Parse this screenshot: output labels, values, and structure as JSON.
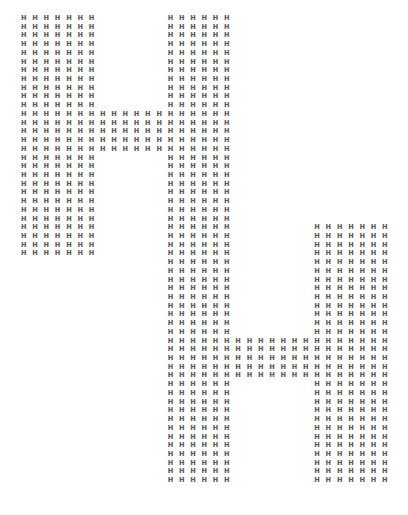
{
  "artwork": {
    "glyph": "H",
    "color": "#5a5a5a",
    "background": "#ffffff",
    "columns": 34,
    "description": "Two block letters 'H' drawn with repeated H characters, offset diagonally",
    "rows": [
      "HHHHHHH      HHHHHH",
      "HHHHHHH      HHHHHH",
      "HHHHHHH      HHHHHH",
      "HHHHHHH      HHHHHH",
      "HHHHHHH      HHHHHH",
      "HHHHHHH      HHHHHH",
      "HHHHHHH      HHHHHH",
      "HHHHHHH      HHHHHH",
      "HHHHHHH      HHHHHH",
      "HHHHHHH      HHHHHH",
      "HHHHHHH      HHHHHH",
      "HHHHHHHHHHHHHHHHHHH",
      "HHHHHHHHHHHHHHHHHHH",
      "HHHHHHHHHHHHHHHHHHH",
      "HHHHHHHHHHHHHHHHHHH",
      "HHHHHHHHHHHHHHHHHHH",
      "HHHHHHH      HHHHHH",
      "HHHHHHH      HHHHHH",
      "HHHHHHH      HHHHHH",
      "HHHHHHH      HHHHHH",
      "HHHHHHH      HHHHHH",
      "HHHHHHH      HHHHHH",
      "HHHHHHH      HHHHHH",
      "HHHHHHH      HHHHHH",
      "HHHHHHH      HHHHHH       HHHHHHH",
      "HHHHHHH      HHHHHH       HHHHHHH",
      "HHHHHHH      HHHHHH       HHHHHHH",
      "HHHHHHH      HHHHHH       HHHHHHH",
      "             HHHHHH       HHHHHHH",
      "             HHHHHH       HHHHHHH",
      "             HHHHHH       HHHHHHH",
      "             HHHHHH       HHHHHHH",
      "             HHHHHH       HHHHHHH",
      "             HHHHHH       HHHHHHH",
      "             HHHHHH       HHHHHHH",
      "             HHHHHH       HHHHHHH",
      "             HHHHHH       HHHHHHH",
      "             HHHHHHHHHHHHHHHHHHHH",
      "             HHHHHHHHHHHHHHHHHHHH",
      "             HHHHHHHHHHHHHHHHHHHH",
      "             HHHHHHHHHHHHHHHHHHHH",
      "             HHHHHHHHHHHHHHHHHHHH",
      "             HHHHHH       HHHHHHH",
      "             HHHHHH       HHHHHHH",
      "             HHHHHH       HHHHHHH",
      "             HHHHHH       HHHHHHH",
      "             HHHHHH       HHHHHHH",
      "             HHHHHH       HHHHHHH",
      "             HHHHHH       HHHHHHH",
      "             HHHHHH       HHHHHHH",
      "             HHHHHH       HHHHHHH",
      "             HHHHHH       HHHHHHH",
      "             HHHHHH       HHHHHHH",
      "             HHHHHH       HHHHHHH"
    ]
  }
}
